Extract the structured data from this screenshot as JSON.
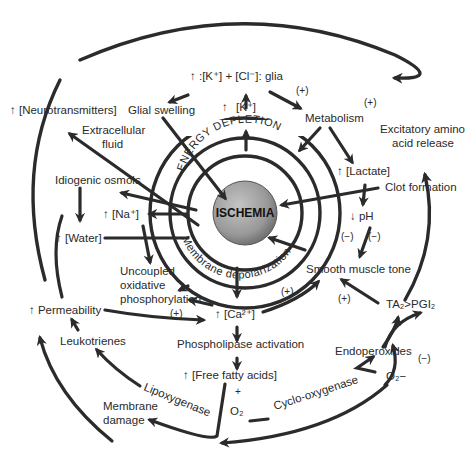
{
  "diagram": {
    "center": {
      "label": "ISCHEMIA",
      "fill": "#9a9a9a"
    },
    "ring_labels": {
      "energy_depletion": "ENERGY DEPLETION",
      "membrane_depolarization": "Membrane depolarization"
    },
    "nodes": {
      "k_cl_glia": "↑ :[K⁺] + [Cl⁻]: glia",
      "k_plus": "[K⁺]",
      "k_plus_arrow": "↑",
      "glial_swelling": "Glial swelling",
      "neurotransmitters": "↑ [Neurotransmitters]",
      "extracellular_fluid_1": "Extracellular",
      "extracellular_fluid_2": "fluid",
      "metabolism": "Metabolism",
      "excitatory_1": "Excitatory amino",
      "excitatory_2": "acid release",
      "lactate": "↑ [Lactate]",
      "clot_formation": "Clot formation",
      "ph": "↓ pH",
      "idiogenic_osmols": "Idiogenic osmols",
      "na_plus": "↑ [Na⁺]",
      "water": "↑ [Water]",
      "uncoupled_1": "Uncoupled",
      "uncoupled_2": "oxidative",
      "uncoupled_3": "phosphorylation",
      "smooth_muscle_tone": "Smooth muscle tone",
      "permeability": "↑ Permeability",
      "ca_plus": "↑ [Ca²⁺]",
      "ta2_pgi2": "TA₂>PGI₂",
      "leukotrienes": "Leukotrienes",
      "phospholipase": "Phospholipase activation",
      "endoperoxides": "Endoperoxides",
      "free_fatty_acids": "↑ [Free fatty acids]",
      "plus_sign": "+",
      "o2": "O₂",
      "o2_minus": "O₂−",
      "lipoxygenase": "Lipoxygenase",
      "cyclooxygenase": "Cyclo-oxygenase",
      "membrane_damage_1": "Membrane",
      "membrane_damage_2": "damage"
    },
    "modifiers": {
      "pos_metabolism": "(+)",
      "pos_excitatory": "(+)",
      "neg_ph_1": "(−)",
      "neg_ph_2": "(−)",
      "pos_ca_smooth": "(+)",
      "pos_ta2_smooth": "(+)",
      "pos_perm_ca": "(+)",
      "neg_o2": "(−)"
    },
    "colors": {
      "line": "#2b2b2b",
      "text": "#2a2a2a",
      "center": "#9a9a9a"
    }
  }
}
